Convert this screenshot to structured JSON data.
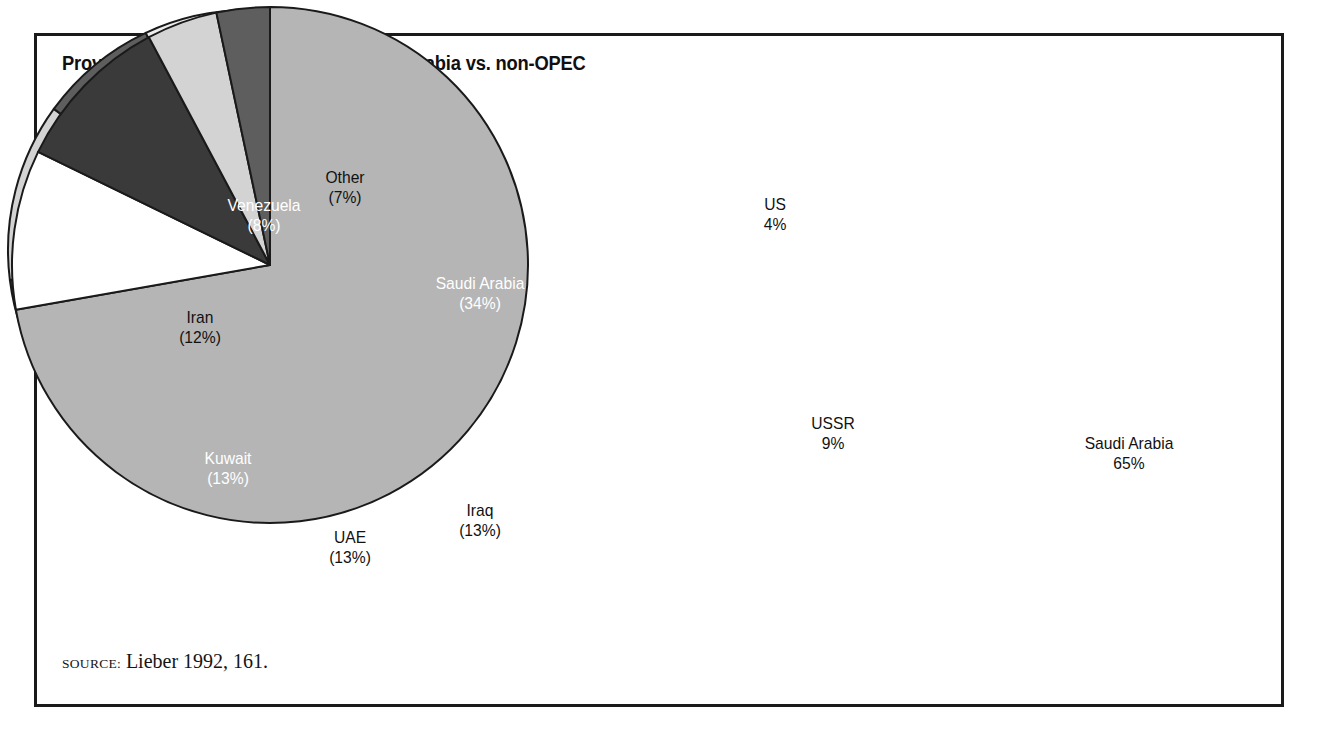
{
  "figure": {
    "title": "Proven oil reserves 1991—OPEC, Saudi Arabia vs. non-OPEC",
    "source_prefix": "Source:",
    "source_text": "Lieber 1992, 161.",
    "frame_color": "#1a1a1a",
    "background": "#ffffff"
  },
  "chart_data": [
    {
      "type": "pie",
      "id": "opec",
      "title": "OPEC",
      "label_format": "name (pct%)",
      "start_angle_deg": 0,
      "direction": "clockwise",
      "categories": [
        "Saudi Arabia",
        "Iraq",
        "UAE",
        "Kuwait",
        "Iran",
        "Venezuela",
        "Other"
      ],
      "values": [
        34,
        13,
        13,
        13,
        12,
        8,
        7
      ],
      "labels": [
        "Saudi Arabia\n(34%)",
        "Iraq\n(13%)",
        "UAE\n(13%)",
        "Kuwait\n(13%)",
        "Iran\n(12%)",
        "Venezuela\n(8%)",
        "Other\n(7%)"
      ],
      "slices": [
        {
          "name": "Saudi Arabia",
          "value": 34,
          "label_line1": "Saudi Arabia",
          "label_line2": "(34%)",
          "fill": "#8a8a8a",
          "text_color": "#ffffff",
          "lx": 480,
          "ly": 294
        },
        {
          "name": "Iraq",
          "value": 13,
          "label_line1": "Iraq",
          "label_line2": "(13%)",
          "fill": "#ffffff",
          "text_color": "#111111",
          "lx": 480,
          "ly": 521
        },
        {
          "name": "UAE",
          "value": 13,
          "label_line1": "UAE",
          "label_line2": "(13%)",
          "fill": "#b3b3b3",
          "text_color": "#111111",
          "lx": 350,
          "ly": 548
        },
        {
          "name": "Kuwait",
          "value": 13,
          "label_line1": "Kuwait",
          "label_line2": "(13%)",
          "fill": "#3a3a3a",
          "text_color": "#ffffff",
          "lx": 228,
          "ly": 469
        },
        {
          "name": "Iran",
          "value": 12,
          "label_line1": "Iran",
          "label_line2": "(12%)",
          "fill": "#d3d3d3",
          "text_color": "#111111",
          "lx": 200,
          "ly": 328
        },
        {
          "name": "Venezuela",
          "value": 8,
          "label_line1": "Venezuela",
          "label_line2": "(8%)",
          "fill": "#5e5e5e",
          "text_color": "#ffffff",
          "lx": 264,
          "ly": 216
        },
        {
          "name": "Other",
          "value": 7,
          "label_line1": "Other",
          "label_line2": "(7%)",
          "fill": "#ededed",
          "text_color": "#111111",
          "lx": 345,
          "ly": 188
        }
      ],
      "center_x": 378,
      "center_y": 375,
      "radius": 240
    },
    {
      "type": "pie",
      "id": "non-opec",
      "title": "Saudi Arabia vs. non-OPEC",
      "label_format": "name pct%",
      "start_angle_deg": 0,
      "direction": "clockwise",
      "categories": [
        "Saudi Arabia",
        "USSR",
        "Mexico",
        "US",
        "Other"
      ],
      "values": [
        65,
        9,
        9,
        4,
        3
      ],
      "labels": [
        "Saudi Arabia\n65%",
        "USSR\n9%",
        "Mexico\n9%",
        "US\n4%",
        "Other\n3%"
      ],
      "slices": [
        {
          "name": "Saudi Arabia",
          "value": 65,
          "label_line1": "Saudi Arabia",
          "label_line2": "65%",
          "fill": "#b5b5b5",
          "text_color": "#111111",
          "lx": 1129,
          "ly": 454
        },
        {
          "name": "USSR",
          "value": 9,
          "label_line1": "USSR",
          "label_line2": "9%",
          "fill": "#ffffff",
          "text_color": "#111111",
          "lx": 833,
          "ly": 434
        },
        {
          "name": "Mexico",
          "value": 9,
          "label_line1": "Mexico",
          "label_line2": "9%",
          "fill": "#3a3a3a",
          "text_color": "#ffffff",
          "lx": 833,
          "ly": 333
        },
        {
          "name": "US",
          "value": 4,
          "label_line1": "US",
          "label_line2": "4%",
          "fill": "#d3d3d3",
          "text_color": "#111111",
          "lx": 775,
          "ly": 215,
          "outside": true
        },
        {
          "name": "Other",
          "value": 3,
          "label_line1": "Other",
          "label_line2": "3%",
          "fill": "#5e5e5e",
          "text_color": "#ffffff",
          "lx": 937,
          "ly": 209
        }
      ],
      "center_x": 1000,
      "center_y": 375,
      "radius": 258
    }
  ]
}
